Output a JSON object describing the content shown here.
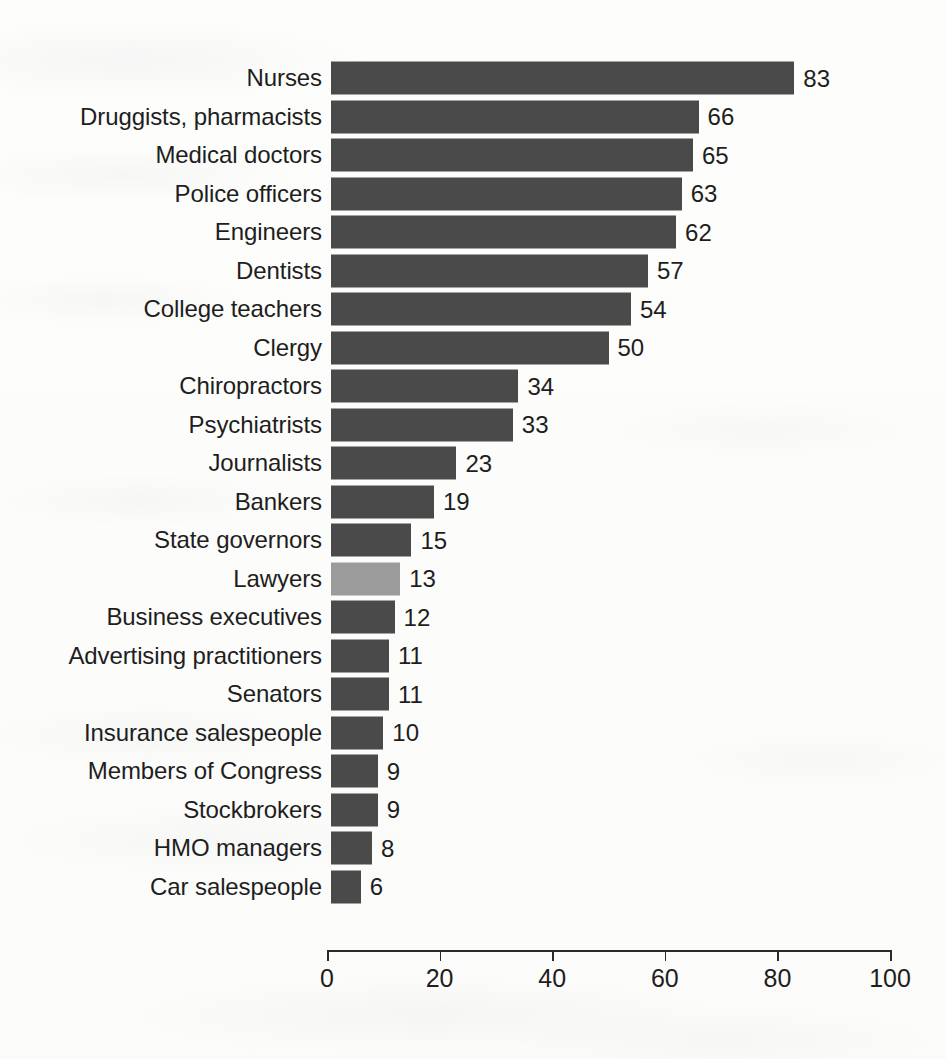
{
  "chart_data": {
    "type": "bar",
    "orientation": "horizontal",
    "title": "",
    "subtitle": "",
    "xlabel": "",
    "ylabel": "",
    "xlim": [
      0,
      100
    ],
    "xticks": [
      0,
      20,
      40,
      60,
      80,
      100
    ],
    "xtick_labels": [
      "0",
      "20",
      "40",
      "60",
      "80",
      "100"
    ],
    "grid": false,
    "legend": false,
    "categories": [
      "Nurses",
      "Druggists, pharmacists",
      "Medical doctors",
      "Police officers",
      "Engineers",
      "Dentists",
      "College teachers",
      "Clergy",
      "Chiropractors",
      "Psychiatrists",
      "Journalists",
      "Bankers",
      "State governors",
      "Lawyers",
      "Business executives",
      "Advertising practitioners",
      "Senators",
      "Insurance salespeople",
      "Members of Congress",
      "Stockbrokers",
      "HMO managers",
      "Car salespeople"
    ],
    "values": [
      83,
      66,
      65,
      63,
      62,
      57,
      54,
      50,
      34,
      33,
      23,
      19,
      15,
      13,
      12,
      11,
      11,
      10,
      9,
      9,
      8,
      6
    ],
    "value_labels": [
      "83",
      "66",
      "65",
      "63",
      "62",
      "57",
      "54",
      "50",
      "34",
      "33",
      "23",
      "19",
      "15",
      "13",
      "12",
      "11",
      "11",
      "10",
      "9",
      "9",
      "8",
      "6"
    ],
    "highlighted_category": "Lawyers",
    "colors": {
      "bar": "#4a4a4a",
      "bar_highlight": "#9b9b9b",
      "text": "#1e1e1e",
      "axis": "#2a2a2a",
      "background": "#fdfdfc"
    }
  }
}
